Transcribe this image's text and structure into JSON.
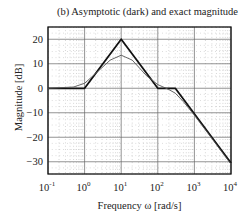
{
  "chart_data": {
    "type": "line",
    "title": "(b) Asymptotic (dark) and exact magnitude",
    "xlabel": "Frequency   ω   [rad/s]",
    "ylabel": "Magnitude [dB]",
    "xscale": "log",
    "xlim": [
      0.1,
      10000
    ],
    "ylim": [
      -35,
      25
    ],
    "grid": true,
    "x_ticks": [
      {
        "base": "10",
        "exp": "-1"
      },
      {
        "base": "10",
        "exp": "0"
      },
      {
        "base": "10",
        "exp": "1"
      },
      {
        "base": "10",
        "exp": "2"
      },
      {
        "base": "10",
        "exp": "3"
      },
      {
        "base": "10",
        "exp": "4"
      }
    ],
    "y_ticks": [
      "20",
      "10",
      "0",
      "−10",
      "−20",
      "−30"
    ],
    "series": [
      {
        "name": "Asymptotic",
        "style": "dark",
        "x": [
          0.1,
          1,
          10,
          100,
          300,
          10000
        ],
        "y": [
          0,
          0,
          20,
          0,
          0,
          -30.5
        ]
      },
      {
        "name": "Exact",
        "style": "light",
        "x": [
          0.1,
          0.5,
          1,
          2,
          5,
          10,
          20,
          50,
          100,
          200,
          300,
          500,
          1000,
          3000,
          10000
        ],
        "y": [
          0,
          0.5,
          2,
          6,
          11.5,
          13.5,
          11.5,
          5,
          1.5,
          -0.5,
          -2,
          -5.5,
          -11,
          -20.5,
          -31
        ]
      }
    ]
  }
}
